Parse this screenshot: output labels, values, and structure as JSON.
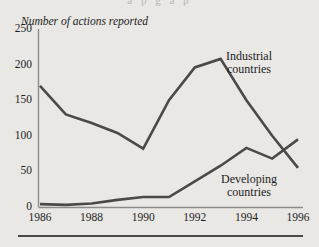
{
  "page": {
    "bleed_text": "a p g a p",
    "rule_color": "#4a4a48",
    "background_color": "#e9e8e5"
  },
  "chart_data": {
    "type": "line",
    "title": "",
    "ylabel": "Number of actions reported",
    "xlabel": "",
    "ylim": [
      0,
      250
    ],
    "xlim": [
      1986,
      1996
    ],
    "yticks": [
      0,
      50,
      100,
      150,
      200,
      250
    ],
    "xticks": [
      1986,
      1988,
      1990,
      1992,
      1994,
      1996
    ],
    "ytick_labels": [
      "0",
      "50",
      "100",
      "150",
      "200",
      "250"
    ],
    "xtick_labels": [
      "1986",
      "1988",
      "1990",
      "1992",
      "1994",
      "1996"
    ],
    "grid": false,
    "legend": "inline-annotations",
    "line_color": "#4a4a48",
    "x": [
      1986,
      1987,
      1988,
      1989,
      1990,
      1991,
      1992,
      1993,
      1994,
      1995,
      1996
    ],
    "series": [
      {
        "name": "Industrial countries",
        "label_line1": "Industrial",
        "label_line2": "countries",
        "values": [
          170,
          130,
          118,
          104,
          82,
          150,
          196,
          208,
          150,
          100,
          55
        ]
      },
      {
        "name": "Developing countries",
        "label_line1": "Developing",
        "label_line2": "countries",
        "values": [
          4,
          3,
          5,
          10,
          14,
          14,
          36,
          58,
          83,
          68,
          95
        ]
      }
    ]
  }
}
